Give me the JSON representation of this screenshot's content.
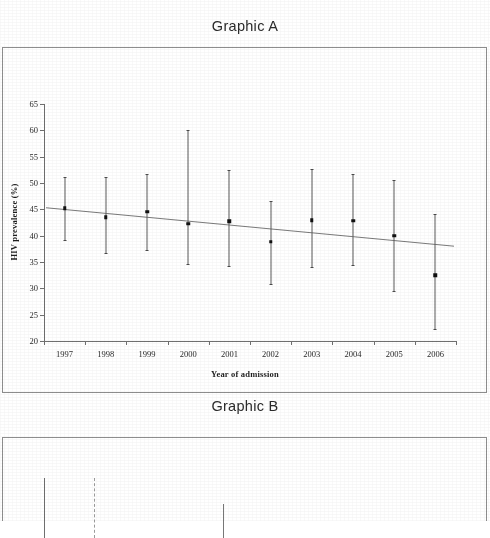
{
  "panels": {
    "a": {
      "title": "Graphic A"
    },
    "b": {
      "title": "Graphic B"
    }
  },
  "chart_data": [
    {
      "type": "scatter",
      "id": "graphic-a",
      "title": "Graphic A",
      "xlabel": "Year of admission",
      "ylabel": "HIV prevalence (%)",
      "categories": [
        "1997",
        "1998",
        "1999",
        "2000",
        "2001",
        "2002",
        "2003",
        "2004",
        "2005",
        "2006"
      ],
      "values": [
        45.2,
        43.5,
        44.5,
        42.3,
        42.7,
        38.8,
        42.9,
        42.8,
        40.0,
        32.5
      ],
      "ci_low": [
        39.2,
        36.7,
        37.3,
        34.7,
        34.3,
        30.9,
        34.0,
        34.5,
        29.5,
        22.3
      ],
      "ci_high": [
        51.2,
        51.2,
        51.8,
        60.1,
        52.4,
        46.6,
        52.6,
        51.8,
        50.6,
        44.2
      ],
      "ylim": [
        20,
        65
      ],
      "yticks": [
        20,
        25,
        30,
        35,
        40,
        45,
        50,
        55,
        60,
        65
      ],
      "grid": false,
      "legend": false,
      "trendline": {
        "type": "linear",
        "y_start": 45.3,
        "y_end": 38.0
      },
      "error_bar_note": "95% confidence interval"
    },
    {
      "type": "line",
      "id": "graphic-b",
      "title": "Graphic B",
      "xlabel": "",
      "ylabel": "",
      "yticks": [
        10,
        9
      ],
      "ylim": [
        9,
        10
      ],
      "grid": false,
      "legend": false,
      "note": "panel cropped at bottom edge of page"
    }
  ],
  "colors": {
    "ink": "#1a1a1a",
    "axis": "#6f6f6f",
    "marker": "#111111",
    "errorbar": "#5a5a5a",
    "frame": "#8d8d8d",
    "paper": "#ffffff"
  }
}
